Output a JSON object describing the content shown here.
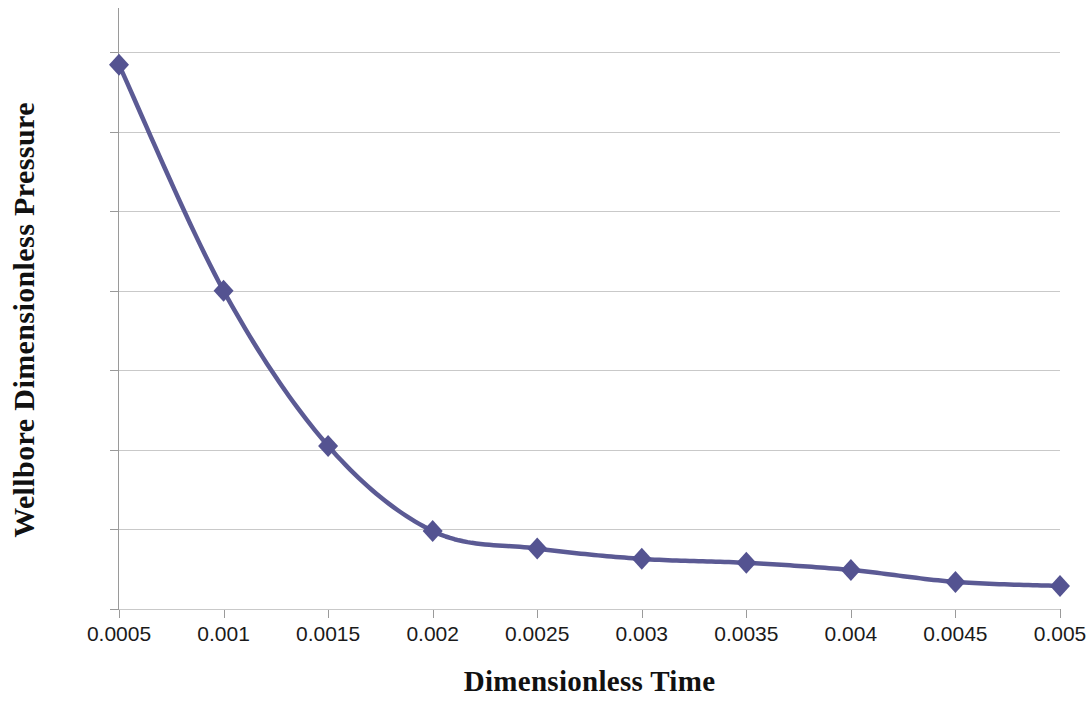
{
  "chart_data": {
    "type": "line",
    "title": "",
    "subtitle": "",
    "xlabel": "Dimensionless Time",
    "ylabel": "Wellbore Dimensionless Pressure",
    "x": [
      0.0005,
      0.001,
      0.0015,
      0.002,
      0.0025,
      0.003,
      0.0035,
      0.004,
      0.0045,
      0.005
    ],
    "values": [
      0.09984,
      0.097,
      0.09505,
      0.09398,
      0.09376,
      0.09363,
      0.09358,
      0.09349,
      0.09334,
      0.09329
    ],
    "series": [
      {
        "name": "Wellbore Dimensionless Pressure",
        "values": [
          0.09984,
          0.097,
          0.09505,
          0.09398,
          0.09376,
          0.09363,
          0.09358,
          0.09349,
          0.09334,
          0.09329
        ]
      }
    ],
    "xlim": [
      0.0005,
      0.005
    ],
    "ylim": [
      0.093,
      0.1
    ],
    "x_tick_labels": [
      "0.0005",
      "0.001",
      "0.0015",
      "0.002",
      "0.0025",
      "0.003",
      "0.0035",
      "0.004",
      "0.0045",
      "0.005"
    ],
    "x_ticks": [
      0.0005,
      0.001,
      0.0015,
      0.002,
      0.0025,
      0.003,
      0.0035,
      0.004,
      0.0045,
      0.005
    ],
    "y_tick_labels": [
      "0.093",
      "0.094",
      "0.095",
      "0.096",
      "0.097",
      "0.098",
      "0.099",
      "0.1"
    ],
    "y_ticks": [
      0.093,
      0.094,
      0.095,
      0.096,
      0.097,
      0.098,
      0.099,
      0.1
    ],
    "grid": "horizontal",
    "legend": "none",
    "marker": "diamond",
    "line_color": "#5B5A94",
    "marker_color": "#545391",
    "grid_color": "#C9C9C9",
    "axis_color": "#9A9A9A",
    "background_color": "#FFFFFF",
    "annotations": []
  }
}
